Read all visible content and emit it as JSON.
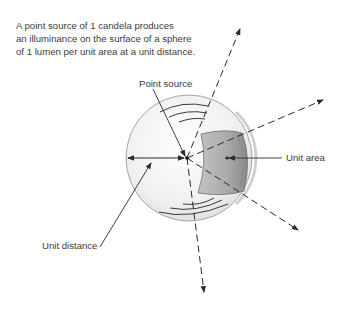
{
  "caption": {
    "lines": [
      "A point source of 1 candela produces",
      "an illuminance on the surface of a sphere",
      "of 1 lumen per unit area at a unit distance."
    ]
  },
  "labels": {
    "point_source": "Point source",
    "unit_area": "Unit area",
    "unit_distance": "Unit distance"
  },
  "colors": {
    "line": "#333333",
    "sphere_fill": "#f2f2f2",
    "sphere_stroke": "#9a9a9a",
    "unit_area_fill": "#a8a8a8",
    "unit_area_dark": "#7d7d7d",
    "text": "#3c3c3c"
  }
}
